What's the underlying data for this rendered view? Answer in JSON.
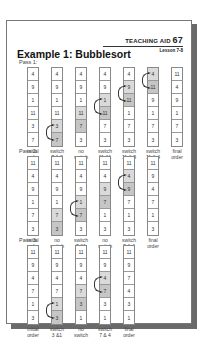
{
  "header": {
    "teaching_aid_label": "TEACHING AID",
    "teaching_aid_number": "67",
    "lesson": "Lesson 7-8"
  },
  "title": "Example 1: Bubblesort",
  "colors": {
    "shade_light": "#dadada",
    "shade_dark": "#c6c6c6",
    "shadow": "#6a6a6a"
  },
  "passes": [
    {
      "label": "Pass 1:",
      "steps": [
        {
          "label": "initial\norder",
          "values": [
            "4",
            "9",
            "1",
            "11",
            "3",
            "7"
          ],
          "shaded": [],
          "arrow": null
        },
        {
          "label": "switch\n7 & 3",
          "values": [
            "4",
            "9",
            "1",
            "11",
            "3",
            "7"
          ],
          "shaded": [
            4,
            5
          ],
          "arrow": 4
        },
        {
          "label": "no\nswitch",
          "values": [
            "4",
            "9",
            "1",
            "11",
            "7",
            "3"
          ],
          "shaded": [
            3,
            4
          ],
          "arrow": null
        },
        {
          "label": "switch\n11 &1",
          "values": [
            "4",
            "9",
            "1",
            "11",
            "7",
            "3"
          ],
          "shaded": [
            2,
            3
          ],
          "arrow": 2
        },
        {
          "label": "switch\n11 & 9",
          "values": [
            "4",
            "9",
            "11",
            "1",
            "7",
            "3"
          ],
          "shaded": [
            1,
            2
          ],
          "arrow": 1
        },
        {
          "label": "switch\n11 & 4",
          "values": [
            "4",
            "11",
            "9",
            "1",
            "7",
            "3"
          ],
          "shaded": [
            0,
            1
          ],
          "arrow": 0
        },
        {
          "label": "final\norder",
          "values": [
            "11",
            "4",
            "9",
            "1",
            "7",
            "3"
          ],
          "shaded": [],
          "arrow": null
        }
      ]
    },
    {
      "label": "Pass 2:",
      "steps": [
        {
          "label": "initial\norder",
          "values": [
            "11",
            "4",
            "9",
            "1",
            "7",
            "3"
          ],
          "shaded": [],
          "arrow": null
        },
        {
          "label": "no\nswitch",
          "values": [
            "11",
            "4",
            "9",
            "1",
            "7",
            "3"
          ],
          "shaded": [
            4,
            5
          ],
          "arrow": null
        },
        {
          "label": "switch\n7 &1",
          "values": [
            "11",
            "4",
            "9",
            "1",
            "7",
            "3"
          ],
          "shaded": [
            3,
            4
          ],
          "arrow": 3
        },
        {
          "label": "no\nswitch",
          "values": [
            "11",
            "4",
            "9",
            "7",
            "1",
            "3"
          ],
          "shaded": [
            2,
            3
          ],
          "arrow": null
        },
        {
          "label": "switch\n9 & 4",
          "values": [
            "11",
            "4",
            "9",
            "7",
            "1",
            "3"
          ],
          "shaded": [
            1,
            2
          ],
          "arrow": 1
        },
        {
          "label": "final\norder",
          "values": [
            "11",
            "9",
            "4",
            "7",
            "1",
            "3"
          ],
          "shaded": [],
          "arrow": null
        }
      ]
    },
    {
      "label": "Pass 3:",
      "steps": [
        {
          "label": "initial\norder",
          "values": [
            "11",
            "9",
            "4",
            "7",
            "1",
            "3"
          ],
          "shaded": [],
          "arrow": null
        },
        {
          "label": "switch\n3 &1",
          "values": [
            "11",
            "9",
            "4",
            "7",
            "1",
            "3"
          ],
          "shaded": [
            4,
            5
          ],
          "arrow": 4
        },
        {
          "label": "no\nswitch",
          "values": [
            "11",
            "9",
            "4",
            "7",
            "3",
            "1"
          ],
          "shaded": [
            3,
            4
          ],
          "arrow": null
        },
        {
          "label": "switch\n7 & 4",
          "values": [
            "11",
            "9",
            "4",
            "7",
            "3",
            "1"
          ],
          "shaded": [
            2,
            3
          ],
          "arrow": 2
        },
        {
          "label": "final\norder",
          "values": [
            "11",
            "9",
            "7",
            "4",
            "3",
            "1"
          ],
          "shaded": [],
          "arrow": null
        }
      ]
    }
  ]
}
